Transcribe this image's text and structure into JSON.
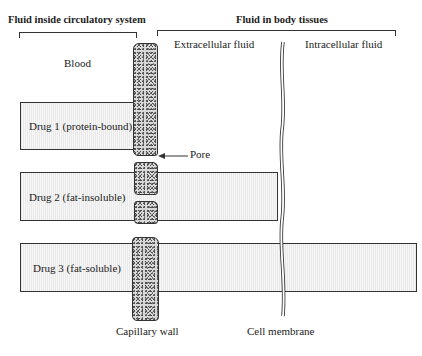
{
  "headers": {
    "left": "Fluid inside circulatory system",
    "right": "Fluid in body tissues"
  },
  "regions": {
    "blood": "Blood",
    "extracellular": "Extracellular fluid",
    "intracellular": "Intracellular fluid"
  },
  "drugs": [
    {
      "label": "Drug 1 (protein-bound)"
    },
    {
      "label": "Drug 2 (fat-insoluble)"
    },
    {
      "label": "Drug 3 (fat-soluble)"
    }
  ],
  "annotations": {
    "pore": "Pore",
    "capillary_wall": "Capillary wall",
    "cell_membrane": "Cell membrane"
  }
}
